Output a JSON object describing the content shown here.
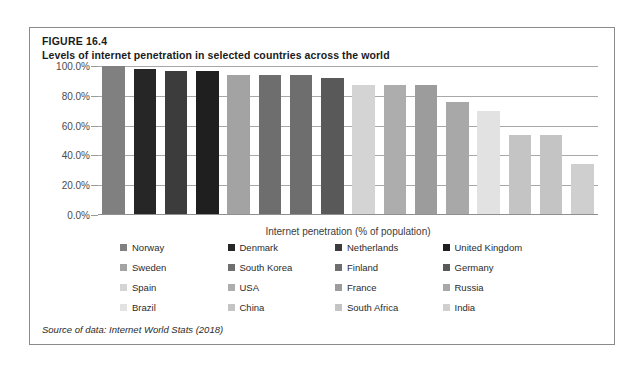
{
  "figure": {
    "number": "FIGURE 16.4",
    "title": "Levels of internet penetration in selected countries across the world",
    "source": "Source of data: Internet World Stats (2018)"
  },
  "chart_data": {
    "type": "bar",
    "title": "Levels of internet penetration in selected countries across the world",
    "xlabel": "Internet penetration (% of population)",
    "ylabel": "",
    "ylim": [
      0,
      100
    ],
    "grid": true,
    "legend_position": "bottom",
    "ytick_labels": [
      "100.0%",
      "80.0%",
      "60.0%",
      "40.0%",
      "20.0%",
      "0.0%"
    ],
    "ytick_values": [
      100,
      80,
      60,
      40,
      20,
      0
    ],
    "categories": [
      "Norway",
      "Denmark",
      "Netherlands",
      "United Kingdom",
      "Sweden",
      "South Korea",
      "Finland",
      "Germany",
      "Spain",
      "USA",
      "France",
      "Russia",
      "Brazil",
      "China",
      "South Africa",
      "India"
    ],
    "values": [
      100.0,
      98.0,
      96.5,
      96.5,
      94.0,
      94.0,
      94.0,
      92.0,
      87.0,
      87.0,
      87.0,
      76.0,
      70.0,
      54.0,
      54.0,
      34.0
    ],
    "colors": [
      "#808080",
      "#262626",
      "#3c3c3c",
      "#1f1f1f",
      "#a3a3a3",
      "#6e6e6e",
      "#6e6e6e",
      "#595959",
      "#d4d4d4",
      "#adadad",
      "#9c9c9c",
      "#a8a8a8",
      "#e2e2e2",
      "#c4c4c4",
      "#c4c4c4",
      "#cfcfcf"
    ]
  }
}
